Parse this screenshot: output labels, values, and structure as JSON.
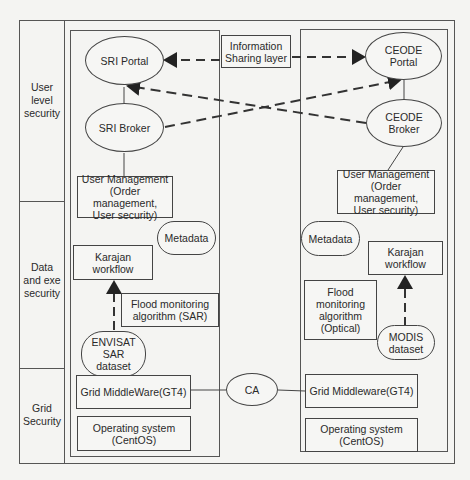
{
  "layers": [
    {
      "id": "user",
      "label": "User\nlevel\nsecurity"
    },
    {
      "id": "data",
      "label": "Data\nand exe\nsecurity"
    },
    {
      "id": "grid",
      "label": "Grid\nSecurity"
    }
  ],
  "center": {
    "info_sharing": "Information\nSharing layer",
    "ca": "CA"
  },
  "sri": {
    "portal": "SRI Portal",
    "broker": "SRI Broker",
    "user_mgmt": "User Management\n(Order management,\nUser security)",
    "metadata": "Metadata",
    "karajan": "Karajan\nworkflow",
    "algorithm": "Flood monitoring\nalgorithm (SAR)",
    "dataset": "ENVISAT\nSAR\ndataset",
    "middleware": "Grid MiddleWare(GT4)",
    "os": "Operating system\n(CentOS)"
  },
  "ceode": {
    "portal": "CEODE\nPortal",
    "broker": "CEODE\nBroker",
    "user_mgmt": "User Management\n(Order management,\nUser security)",
    "metadata": "Metadata",
    "karajan": "Karajan\nworkflow",
    "algorithm": "Flood\nmonitoring\nalgorithm\n(Optical)",
    "dataset": "MODIS\ndataset",
    "middleware": "Grid Middleware(GT4)",
    "os": "Operating system\n(CentOS)"
  },
  "colors": {
    "line": "#333333",
    "background": "#f4f4f2"
  }
}
